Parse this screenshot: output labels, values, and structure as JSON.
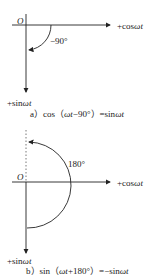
{
  "diagram_a": {
    "origin_label": "O",
    "x_axis_label_prefix": "+cos",
    "x_axis_label_var": "ωt",
    "y_axis_label_prefix": "+sin",
    "y_axis_label_var": "ωt",
    "angle_label": "−90°",
    "caption_prefix": "a）cos（",
    "caption_var": "ωt",
    "caption_mid": "−90°）=sin",
    "caption_var2": "ωt"
  },
  "diagram_b": {
    "origin_label": "O",
    "x_axis_label_prefix": "+cos",
    "x_axis_label_var": "ωt",
    "y_axis_label_prefix": "+sin",
    "y_axis_label_var": "ωt",
    "angle_label": "180°",
    "caption_prefix": "b）sin（",
    "caption_var": "ωt",
    "caption_mid": "+180°）=−sin",
    "caption_var2": "ωt"
  },
  "colors": {
    "line": "#222222",
    "background": "#ffffff"
  }
}
